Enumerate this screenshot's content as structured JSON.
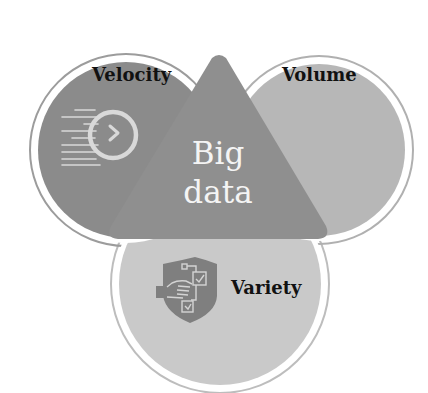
{
  "diagram": {
    "type": "venn",
    "center": {
      "line1": "Big",
      "line2": "data"
    },
    "sets": [
      {
        "id": "velocity",
        "label": "Velocity",
        "icon": "speed-arrow-clock-icon",
        "color": "#8a8a8a"
      },
      {
        "id": "volume",
        "label": "Volume",
        "icon": "",
        "color": "#b6b6b6"
      },
      {
        "id": "variety",
        "label": "Variety",
        "icon": "shield-checklist-hand-icon",
        "color": "#c8c8c8"
      }
    ],
    "center_color": "#8f8f8f",
    "ring_color": "#ffffff",
    "outline_color": "#a9a9a9"
  }
}
